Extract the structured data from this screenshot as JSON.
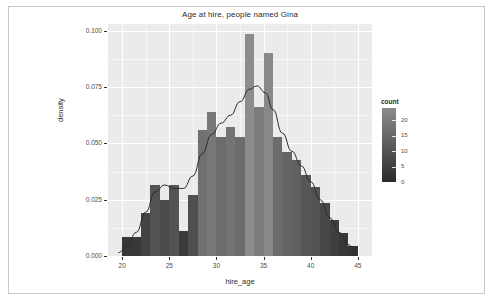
{
  "chart_data": {
    "type": "bar",
    "title": "Age at hire, people named Gina",
    "xlabel": "hire_age",
    "ylabel": "density",
    "xlim": [
      18.5,
      46.5
    ],
    "ylim": [
      0.0,
      0.103
    ],
    "xticks": [
      "20",
      "25",
      "30",
      "35",
      "40",
      "45"
    ],
    "xtick_values": [
      20,
      25,
      30,
      35,
      40,
      45
    ],
    "yticks": [
      "0.000",
      "0.025",
      "0.050",
      "0.075",
      "0.100"
    ],
    "ytick_values": [
      0.0,
      0.025,
      0.05,
      0.075,
      0.1
    ],
    "grid": true,
    "bin_width": 1,
    "bins": [
      {
        "x0": 20.0,
        "x1": 21.0,
        "density": 0.0085,
        "count": 3
      },
      {
        "x0": 21.0,
        "x1": 22.0,
        "density": 0.0085,
        "count": 3
      },
      {
        "x0": 22.0,
        "x1": 23.0,
        "density": 0.019,
        "count": 6
      },
      {
        "x0": 23.0,
        "x1": 24.0,
        "density": 0.0315,
        "count": 10
      },
      {
        "x0": 24.0,
        "x1": 25.0,
        "density": 0.025,
        "count": 8
      },
      {
        "x0": 25.0,
        "x1": 26.0,
        "density": 0.0315,
        "count": 10
      },
      {
        "x0": 26.0,
        "x1": 27.0,
        "density": 0.011,
        "count": 4
      },
      {
        "x0": 27.0,
        "x1": 28.0,
        "density": 0.027,
        "count": 9
      },
      {
        "x0": 28.0,
        "x1": 29.0,
        "density": 0.056,
        "count": 17
      },
      {
        "x0": 29.0,
        "x1": 30.0,
        "density": 0.064,
        "count": 19
      },
      {
        "x0": 30.0,
        "x1": 31.0,
        "density": 0.053,
        "count": 16
      },
      {
        "x0": 31.0,
        "x1": 32.0,
        "density": 0.0575,
        "count": 18
      },
      {
        "x0": 32.0,
        "x1": 33.0,
        "density": 0.053,
        "count": 16
      },
      {
        "x0": 33.0,
        "x1": 34.0,
        "density": 0.0985,
        "count": 24
      },
      {
        "x0": 34.0,
        "x1": 35.0,
        "density": 0.066,
        "count": 20
      },
      {
        "x0": 35.0,
        "x1": 36.0,
        "density": 0.09,
        "count": 23
      },
      {
        "x0": 36.0,
        "x1": 37.0,
        "density": 0.053,
        "count": 16
      },
      {
        "x0": 37.0,
        "x1": 38.0,
        "density": 0.046,
        "count": 14
      },
      {
        "x0": 38.0,
        "x1": 39.0,
        "density": 0.0425,
        "count": 13
      },
      {
        "x0": 39.0,
        "x1": 40.0,
        "density": 0.036,
        "count": 11
      },
      {
        "x0": 40.0,
        "x1": 41.0,
        "density": 0.0305,
        "count": 10
      },
      {
        "x0": 41.0,
        "x1": 42.0,
        "density": 0.0235,
        "count": 7
      },
      {
        "x0": 42.0,
        "x1": 43.0,
        "density": 0.016,
        "count": 5
      },
      {
        "x0": 43.0,
        "x1": 44.0,
        "density": 0.01,
        "count": 3
      },
      {
        "x0": 44.0,
        "x1": 45.0,
        "density": 0.0045,
        "count": 2
      }
    ],
    "density_curve": [
      {
        "x": 19.6,
        "y": 0.0015
      },
      {
        "x": 20.5,
        "y": 0.0045
      },
      {
        "x": 21.5,
        "y": 0.0105
      },
      {
        "x": 22.5,
        "y": 0.0195
      },
      {
        "x": 23.5,
        "y": 0.0285
      },
      {
        "x": 24.5,
        "y": 0.0315
      },
      {
        "x": 25.5,
        "y": 0.03
      },
      {
        "x": 26.5,
        "y": 0.03
      },
      {
        "x": 27.5,
        "y": 0.0355
      },
      {
        "x": 28.5,
        "y": 0.0455
      },
      {
        "x": 29.5,
        "y": 0.054
      },
      {
        "x": 30.5,
        "y": 0.059
      },
      {
        "x": 31.5,
        "y": 0.0625
      },
      {
        "x": 32.5,
        "y": 0.0685
      },
      {
        "x": 33.5,
        "y": 0.074
      },
      {
        "x": 34.3,
        "y": 0.0755
      },
      {
        "x": 35.2,
        "y": 0.0725
      },
      {
        "x": 36.0,
        "y": 0.065
      },
      {
        "x": 37.0,
        "y": 0.0545
      },
      {
        "x": 38.0,
        "y": 0.0465
      },
      {
        "x": 39.0,
        "y": 0.04
      },
      {
        "x": 40.0,
        "y": 0.033
      },
      {
        "x": 41.0,
        "y": 0.025
      },
      {
        "x": 42.0,
        "y": 0.017
      },
      {
        "x": 43.0,
        "y": 0.0105
      },
      {
        "x": 44.0,
        "y": 0.005
      },
      {
        "x": 44.8,
        "y": 0.002
      }
    ],
    "legend": {
      "title": "count",
      "position": "right",
      "ticks": [
        "20",
        "15",
        "10",
        "5",
        "0"
      ],
      "tick_values": [
        20,
        15,
        10,
        5,
        0
      ],
      "range": [
        0,
        24
      ],
      "gradient_low_color": "#2b2b2b",
      "gradient_high_color": "#8c8c8c"
    },
    "colors": {
      "panel_background": "#ebebeb",
      "grid_color": "#ffffff",
      "curve_color": "#2b2b2b",
      "axis_text": "#4d4d4d",
      "title_text": "#2b2b2b",
      "frame_border": "#c8c8c8"
    }
  }
}
